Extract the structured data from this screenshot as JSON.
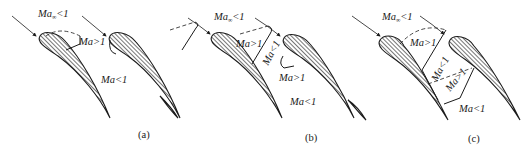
{
  "figure": {
    "panels": [
      {
        "id": "a",
        "caption": "(a)",
        "labels": {
          "freestream": "Ma",
          "freestream_sub": "∞",
          "freestream_rel": "<1",
          "supersonic_pocket": "Ma>1",
          "exit": "Ma<1"
        }
      },
      {
        "id": "b",
        "caption": "(b)",
        "labels": {
          "freestream": "Ma",
          "freestream_sub": "∞",
          "freestream_rel": "<1",
          "supersonic_region": "Ma>1",
          "subsonic_after_shock": "Ma<1",
          "second_supersonic": "Ma>1",
          "exit": "Ma<1"
        }
      },
      {
        "id": "c",
        "caption": "(c)",
        "labels": {
          "freestream": "Ma",
          "freestream_sub": "∞",
          "freestream_rel": "<1",
          "supersonic_region": "Ma>1",
          "subsonic_between_shocks": "Ma<1",
          "second_supersonic": "Ma>1",
          "exit": "Ma<1"
        }
      }
    ],
    "colors": {
      "ink": "#1a1a1a",
      "background": "#ffffff"
    }
  }
}
